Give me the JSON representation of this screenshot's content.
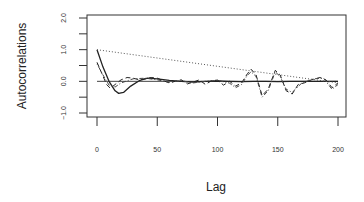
{
  "chart_data": {
    "type": "line",
    "title": "",
    "xlabel": "Lag",
    "ylabel": "Autocorrelations",
    "xlim": [
      0,
      200
    ],
    "ylim": [
      -1.0,
      2.0
    ],
    "x_ticks": [
      0,
      50,
      100,
      150,
      200
    ],
    "x_tick_labels": [
      "0",
      "50",
      "100",
      "150",
      "200"
    ],
    "y_ticks": [
      -1.0,
      -0.5,
      0.0,
      0.5,
      1.0,
      1.5,
      2.0
    ],
    "y_tick_labels": [
      "-1.0",
      "",
      "0.0",
      "",
      "1.0",
      "",
      "2.0"
    ],
    "grid": false,
    "legend": null,
    "reference_line": {
      "y": 0.0,
      "style": "solid"
    },
    "series": [
      {
        "name": "solid",
        "style": "solid",
        "color": "#222222",
        "x": [
          0,
          5,
          10,
          15,
          18,
          22,
          28,
          35,
          42,
          50,
          60,
          70,
          80,
          90,
          100,
          110,
          120,
          130,
          140,
          150,
          160,
          170,
          180,
          190,
          200
        ],
        "values": [
          1.0,
          0.45,
          0.0,
          -0.3,
          -0.38,
          -0.35,
          -0.15,
          0.02,
          0.1,
          0.08,
          0.03,
          0.0,
          -0.02,
          0.0,
          0.01,
          0.0,
          -0.01,
          0.0,
          0.0,
          -0.01,
          0.0,
          0.0,
          0.0,
          0.0,
          0.0
        ]
      },
      {
        "name": "dashed",
        "style": "dashed",
        "color": "#222222",
        "x": [
          0,
          4,
          8,
          11,
          15,
          20,
          25,
          30,
          35,
          40,
          45,
          50,
          55,
          60,
          65,
          70,
          75,
          80,
          85,
          90,
          95,
          100,
          105,
          110,
          115,
          120,
          125,
          128,
          132,
          137,
          142,
          148,
          152,
          157,
          162,
          167,
          172,
          178,
          185,
          190,
          195,
          200
        ],
        "values": [
          0.6,
          0.25,
          -0.1,
          -0.22,
          -0.1,
          0.05,
          0.12,
          0.1,
          0.05,
          0.08,
          0.12,
          0.1,
          0.02,
          -0.05,
          0.0,
          0.05,
          -0.08,
          -0.02,
          0.05,
          -0.1,
          0.02,
          0.04,
          -0.12,
          0.0,
          -0.15,
          -0.05,
          0.25,
          0.38,
          0.2,
          -0.45,
          -0.25,
          0.35,
          0.2,
          -0.3,
          -0.4,
          -0.1,
          -0.05,
          0.05,
          0.12,
          0.05,
          -0.2,
          -0.05
        ]
      },
      {
        "name": "dot-dash",
        "style": "dotdash",
        "color": "#444444",
        "x": [
          0,
          5,
          10,
          15,
          20,
          30,
          40,
          50,
          60,
          70,
          80,
          90,
          100,
          110,
          115,
          120,
          125,
          128,
          132,
          137,
          142,
          148,
          152,
          157,
          162,
          170,
          180,
          188,
          195,
          200
        ],
        "values": [
          0.55,
          0.2,
          -0.12,
          -0.18,
          -0.05,
          0.08,
          0.1,
          0.05,
          -0.03,
          0.02,
          -0.05,
          0.0,
          0.03,
          -0.06,
          -0.2,
          -0.1,
          0.2,
          0.3,
          0.15,
          -0.5,
          -0.3,
          0.3,
          0.15,
          -0.25,
          -0.35,
          -0.05,
          0.08,
          0.1,
          -0.25,
          -0.1
        ]
      },
      {
        "name": "dotted",
        "style": "dotted",
        "color": "#555555",
        "x": [
          0,
          200
        ],
        "values": [
          1.0,
          -0.05
        ]
      }
    ]
  }
}
